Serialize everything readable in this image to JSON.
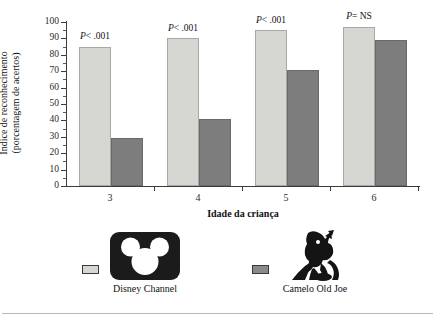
{
  "chart_data": {
    "type": "bar",
    "title": "",
    "xlabel": "Idade da criança",
    "ylabel_line1": "Índice de reconhecimento",
    "ylabel_line2": "(porcentagem de acertos)",
    "categories": [
      "3",
      "4",
      "5",
      "6"
    ],
    "ylim": [
      0,
      100
    ],
    "ytick_step": 10,
    "yticks": [
      "0",
      "10",
      "20",
      "30",
      "40",
      "50",
      "60",
      "70",
      "80",
      "90",
      "100"
    ],
    "grid": false,
    "legend_position": "bottom",
    "series": [
      {
        "name": "Disney Channel",
        "color": "#d6d6d2",
        "values": [
          85,
          90,
          95,
          97
        ]
      },
      {
        "name": "Camelo Old Joe",
        "color": "#7d7d7d",
        "values": [
          29,
          41,
          71,
          89
        ]
      }
    ],
    "annotations": [
      {
        "p_symbol": "P",
        "text": "< .001"
      },
      {
        "p_symbol": "P",
        "text": "< .001"
      },
      {
        "p_symbol": "P",
        "text": "< .001"
      },
      {
        "p_symbol": "P",
        "text": "= NS"
      }
    ]
  },
  "legend": {
    "entries": [
      {
        "label": "Disney Channel",
        "swatch": "light",
        "icon": "mickey-mouse-logo"
      },
      {
        "label": "Camelo Old Joe",
        "swatch": "dark",
        "icon": "joe-camel-logo"
      }
    ]
  }
}
